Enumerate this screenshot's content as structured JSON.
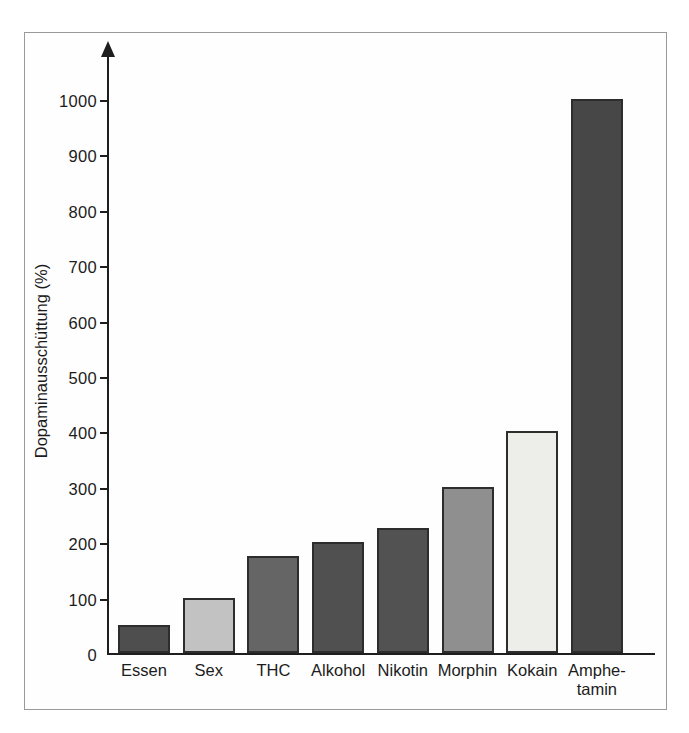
{
  "chart_data": {
    "type": "bar",
    "title": "",
    "xlabel": "",
    "ylabel": "Dopaminausschüttung (%)",
    "ylim": [
      0,
      1000
    ],
    "ytick_interval": 100,
    "yticks": [
      0,
      100,
      200,
      300,
      400,
      500,
      600,
      700,
      800,
      900,
      1000
    ],
    "grid": false,
    "legend": null,
    "categories": [
      "Essen",
      "Sex",
      "THC",
      "Alkohol",
      "Nikotin",
      "Morphin",
      "Kokain",
      "Amphetamin"
    ],
    "values": [
      50,
      100,
      175,
      200,
      225,
      300,
      400,
      1000
    ],
    "bars": [
      {
        "label": "Essen",
        "display_lines": [
          "Essen"
        ],
        "value": 50,
        "color": "#4e4e4e"
      },
      {
        "label": "Sex",
        "display_lines": [
          "Sex"
        ],
        "value": 100,
        "color": "#c2c2c2"
      },
      {
        "label": "THC",
        "display_lines": [
          "THC"
        ],
        "value": 175,
        "color": "#656565"
      },
      {
        "label": "Alkohol",
        "display_lines": [
          "Alkohol"
        ],
        "value": 200,
        "color": "#505050"
      },
      {
        "label": "Nikotin",
        "display_lines": [
          "Nikotin"
        ],
        "value": 225,
        "color": "#525252"
      },
      {
        "label": "Morphin",
        "display_lines": [
          "Morphin"
        ],
        "value": 300,
        "color": "#8f8f8f"
      },
      {
        "label": "Kokain",
        "display_lines": [
          "Kokain"
        ],
        "value": 400,
        "color": "#edede9"
      },
      {
        "label": "Amphetamin",
        "display_lines": [
          "Amphe-",
          "tamin"
        ],
        "value": 1000,
        "color": "#474747"
      }
    ],
    "bar_border_color": "#2d2d2d",
    "axis_color": "#1e1e1e",
    "frame_border_color": "#9a9a9a"
  }
}
